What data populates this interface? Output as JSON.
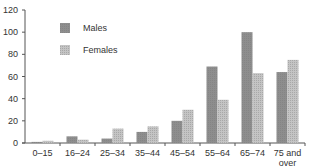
{
  "chart_data": {
    "type": "bar",
    "title": "",
    "xlabel": "",
    "ylabel": "",
    "categories": [
      "0–15",
      "16–24",
      "25–34",
      "35–44",
      "45–54",
      "55–64",
      "65–74",
      "75 and over"
    ],
    "category_lines": [
      [
        "0–15"
      ],
      [
        "16–24"
      ],
      [
        "25–34"
      ],
      [
        "35–44"
      ],
      [
        "45–54"
      ],
      [
        "55–64"
      ],
      [
        "65–74"
      ],
      [
        "75 and",
        "over"
      ]
    ],
    "series": [
      {
        "name": "Males",
        "values": [
          1,
          6,
          4,
          10,
          20,
          69,
          100,
          64
        ],
        "color": "#8c8c8c",
        "pattern": "solid"
      },
      {
        "name": "Females",
        "values": [
          2,
          3,
          13,
          15,
          30,
          39,
          63,
          75
        ],
        "color": "#b4b4b4",
        "pattern": "grid"
      }
    ],
    "ylim": [
      0,
      120
    ],
    "yticks": [
      0,
      20,
      40,
      60,
      80,
      100,
      120
    ],
    "grid": false,
    "legend": {
      "position": "top-left",
      "entries": [
        "Males",
        "Females"
      ]
    }
  }
}
